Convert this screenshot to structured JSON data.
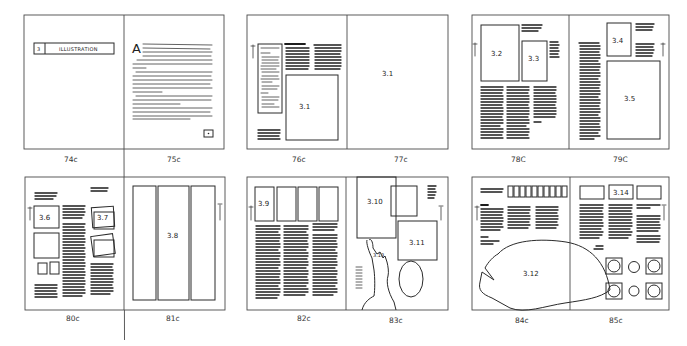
{
  "diagram": {
    "spreads": [
      {
        "id": "spread-74-75",
        "pages": [
          {
            "label": "74c",
            "elements": [
              "chapter-banner"
            ]
          },
          {
            "label": "75c",
            "elements": [
              "drop-cap",
              "body-text",
              "small-box"
            ]
          }
        ],
        "chapter_banner": {
          "number": "3",
          "title": "ILLUSTRATION"
        },
        "drop_cap": "A"
      },
      {
        "id": "spread-76-77",
        "pages": [
          {
            "label": "76c",
            "figures": [
              "3.1"
            ]
          },
          {
            "label": "77c",
            "figures": [
              "3.1"
            ]
          }
        ]
      },
      {
        "id": "spread-78-79",
        "pages": [
          {
            "label": "78C",
            "figures": [
              "3.2",
              "3.3"
            ]
          },
          {
            "label": "79C",
            "figures": [
              "3.4",
              "3.5"
            ]
          }
        ]
      },
      {
        "id": "spread-80-81",
        "pages": [
          {
            "label": "80c",
            "figures": [
              "3.6",
              "3.7"
            ]
          },
          {
            "label": "81c",
            "figures": [
              "3.8"
            ]
          }
        ]
      },
      {
        "id": "spread-82-83",
        "pages": [
          {
            "label": "82c",
            "figures": [
              "3.9"
            ]
          },
          {
            "label": "83c",
            "figures": [
              "3.10",
              "3.11",
              "3.13"
            ]
          }
        ]
      },
      {
        "id": "spread-84-85",
        "pages": [
          {
            "label": "84c",
            "figures": [
              "3.12"
            ]
          },
          {
            "label": "85c",
            "figures": [
              "3.14"
            ]
          }
        ]
      }
    ],
    "figure_labels": {
      "f3_1": "3.1",
      "f3_2": "3.2",
      "f3_3": "3.3",
      "f3_4": "3.4",
      "f3_5": "3.5",
      "f3_6": "3.6",
      "f3_7": "3.7",
      "f3_8": "3.8",
      "f3_9": "3.9",
      "f3_10": "3.10",
      "f3_11": "3.11",
      "f3_12": "3.12",
      "f3_13": "3.13",
      "f3_14": "3.14"
    },
    "page_labels": {
      "p74": "74c",
      "p75": "75c",
      "p76": "76c",
      "p77": "77c",
      "p78": "78C",
      "p79": "79C",
      "p80": "80c",
      "p81": "81c",
      "p82": "82c",
      "p83": "83c",
      "p84": "84c",
      "p85": "85c"
    },
    "chapter_banner": {
      "number": "3",
      "title": "ILLUSTRATION"
    },
    "drop_cap": "A"
  }
}
